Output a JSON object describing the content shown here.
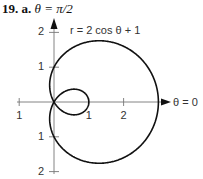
{
  "heading": {
    "number": "19.",
    "part": "a.",
    "axis_label": "θ = π/2"
  },
  "equation_label": "r = 2 cos θ + 1",
  "polar_axis_label": "θ = 0",
  "colors": {
    "curve": "#111111",
    "axis": "#777777",
    "text": "#333333"
  },
  "chart_data": {
    "type": "line",
    "coordinate_system": "polar",
    "title": "19. a.",
    "equation": "r = 2 cos θ + 1",
    "function": {
      "a": 2,
      "b": 1,
      "form": "r = a*cos(theta) + b"
    },
    "theta_range": [
      0,
      6.2832
    ],
    "curve_name": "limaçon with inner loop",
    "axes": {
      "vertical_label": "θ = π/2",
      "horizontal_label": "θ = 0",
      "x_ticks": [
        {
          "value": -1,
          "label": "1"
        },
        {
          "value": 1,
          "label": "1"
        },
        {
          "value": 2,
          "label": "2"
        }
      ],
      "y_ticks": [
        {
          "value": 2,
          "label": "2"
        },
        {
          "value": 1,
          "label": "1"
        },
        {
          "value": -1,
          "label": "1"
        },
        {
          "value": -2,
          "label": "2"
        }
      ],
      "xlim": [
        -1.0,
        3.3
      ],
      "ylim": [
        -2.0,
        2.1
      ]
    },
    "key_points": [
      {
        "theta": "0",
        "r": 3
      },
      {
        "theta": "π/2",
        "r": 1
      },
      {
        "theta": "2π/3",
        "r": 0
      },
      {
        "theta": "π",
        "r": -1
      },
      {
        "theta": "3π/2",
        "r": 1
      }
    ],
    "grid": false,
    "legend": false
  }
}
